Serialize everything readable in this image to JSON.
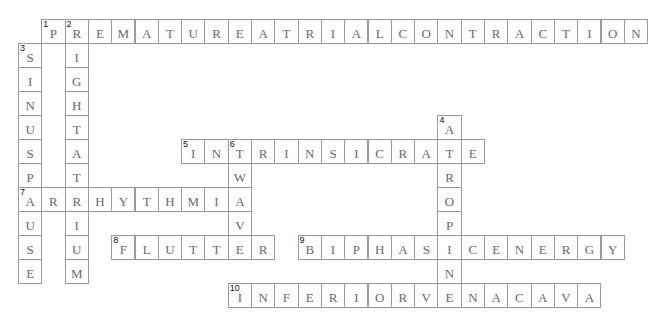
{
  "puzzle": {
    "grid": {
      "origin_x": 18,
      "origin_y": 19,
      "cell_width": 23.3,
      "cell_height": 24,
      "border_color": "#9a9a9a",
      "letter_color": "#6a6a6a",
      "number_color": "#111111"
    },
    "entries": [
      {
        "number": "1",
        "direction": "across",
        "row": 0,
        "col": 1,
        "answer": "PREMATUREATRIALCONTRACTION"
      },
      {
        "number": "2",
        "direction": "down",
        "row": 0,
        "col": 2,
        "answer": "RIGHTATRIUM"
      },
      {
        "number": "3",
        "direction": "down",
        "row": 1,
        "col": 0,
        "answer": "SINUSPAUSE"
      },
      {
        "number": "4",
        "direction": "down",
        "row": 4,
        "col": 18,
        "answer": "ATROPINE"
      },
      {
        "number": "5",
        "direction": "across",
        "row": 5,
        "col": 7,
        "answer": "INTRINSICRATE"
      },
      {
        "number": "6",
        "direction": "down",
        "row": 5,
        "col": 9,
        "answer": "TWAVE"
      },
      {
        "number": "7",
        "direction": "across",
        "row": 7,
        "col": 0,
        "answer": "ARRHYTHMIA"
      },
      {
        "number": "8",
        "direction": "across",
        "row": 9,
        "col": 4,
        "answer": "FLUTTER"
      },
      {
        "number": "9",
        "direction": "across",
        "row": 9,
        "col": 12,
        "answer": "BIPHASICENERGY"
      },
      {
        "number": "10",
        "direction": "across",
        "row": 11,
        "col": 9,
        "answer": "INFERIORVENACAVA"
      }
    ]
  }
}
